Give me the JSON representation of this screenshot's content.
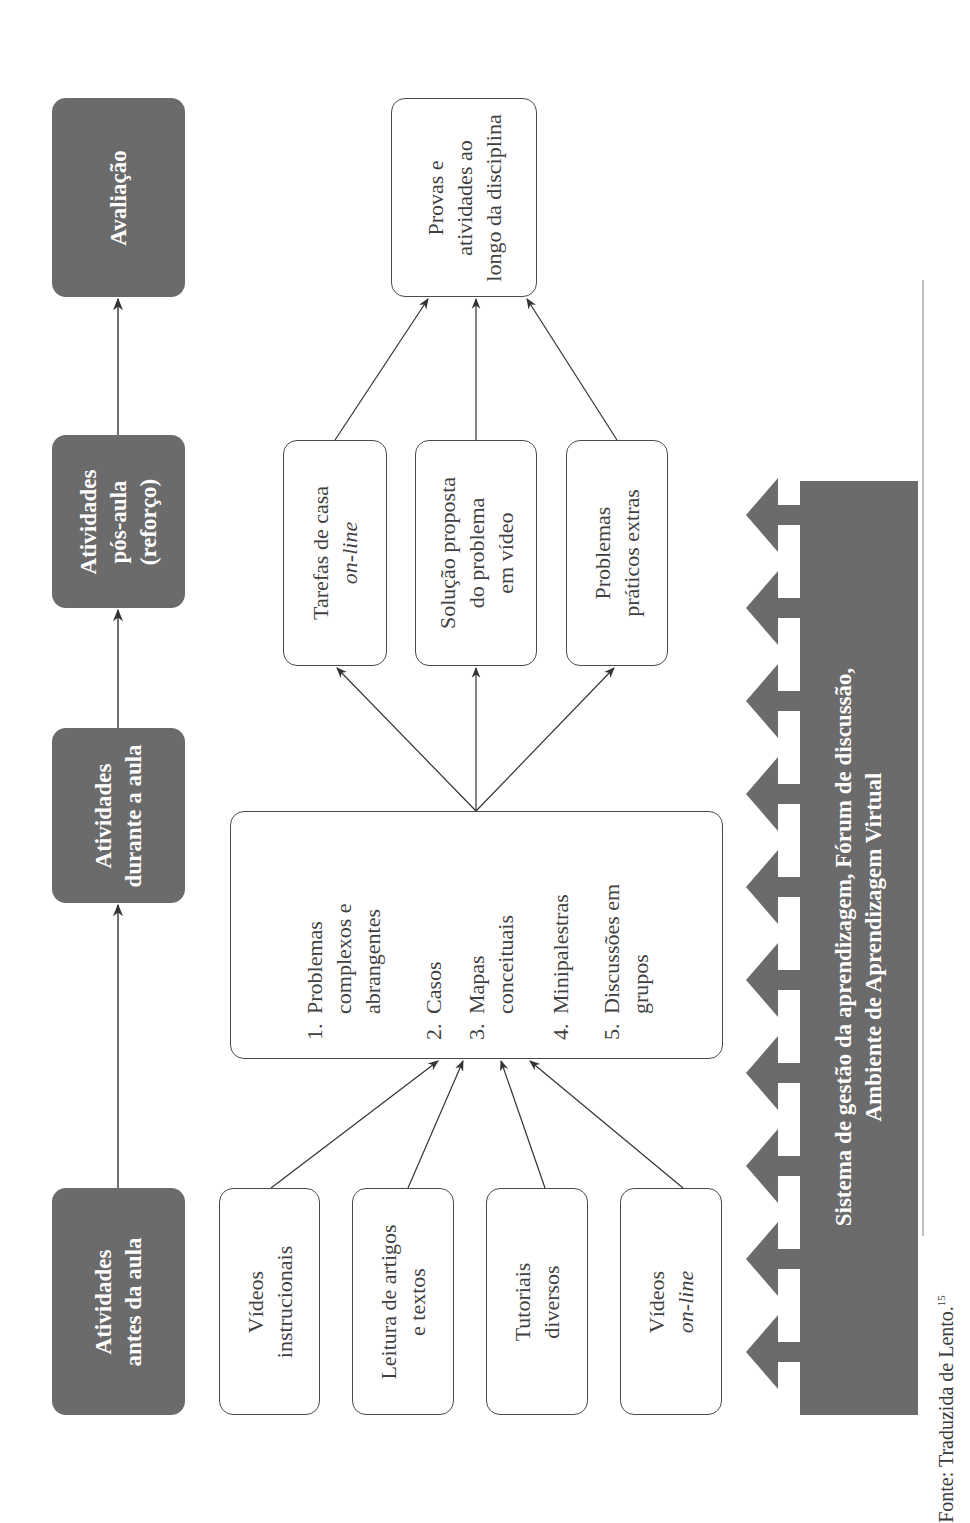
{
  "header": {
    "stages": [
      {
        "line1": "Atividades",
        "line2": "antes da aula"
      },
      {
        "line1": "Atividades",
        "line2": "durante a aula"
      },
      {
        "line1": "Atividades",
        "line2": "pós-aula",
        "line3": "(reforço)"
      },
      {
        "line1": "Avaliação"
      }
    ]
  },
  "pre_class": [
    {
      "line1": "Vídeos",
      "line2": "instrucionais"
    },
    {
      "line1": "Leitura de artigos",
      "line2": "e textos"
    },
    {
      "line1": "Tutoriais",
      "line2": "diversos"
    },
    {
      "line1": "Vídeos",
      "line2": "on-line"
    }
  ],
  "in_class": {
    "items": [
      {
        "num": "1.",
        "lines": [
          "Problemas",
          "complexos e",
          "abrangentes"
        ]
      },
      {
        "num": "2.",
        "lines": [
          "Casos"
        ]
      },
      {
        "num": "3.",
        "lines": [
          "Mapas",
          "conceituais"
        ]
      },
      {
        "num": "4.",
        "lines": [
          "Minipalestras"
        ]
      },
      {
        "num": "5.",
        "lines": [
          "Discussões em",
          "grupos"
        ]
      }
    ]
  },
  "post_class": [
    {
      "line1": "Tarefas de casa",
      "line2": "on-line"
    },
    {
      "line1": "Solução proposta",
      "line2": "do problema",
      "line3": "em vídeo"
    },
    {
      "line1": "Problemas",
      "line2": "práticos extras"
    }
  ],
  "evaluation": {
    "line1": "Provas e",
    "line2": "atividades ao",
    "line3": "longo da disciplina"
  },
  "platform_bar": {
    "line1": "Sistema de gestão da aprendizagem, Fórum de discussão,",
    "line2": "Ambiente de Aprendizagem Virtual",
    "arrow_count": 10
  },
  "source": {
    "text": "Fonte: Traduzida de Lento.",
    "footnote": "15"
  },
  "colors": {
    "dark_fill": "#6b6b6b",
    "line": "#4a4a4a",
    "background": "#ffffff"
  }
}
